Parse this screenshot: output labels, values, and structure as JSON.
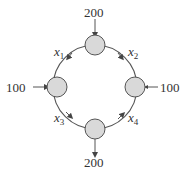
{
  "diagram": {
    "type": "network-flow",
    "nodes": [
      {
        "id": "top",
        "external": "200",
        "direction": "in"
      },
      {
        "id": "left",
        "external": "100",
        "direction": "in"
      },
      {
        "id": "right",
        "external": "100",
        "direction": "out"
      },
      {
        "id": "bottom",
        "external": "200",
        "direction": "out"
      }
    ],
    "edges": [
      {
        "var": "x",
        "sub": "1",
        "from": "top",
        "to": "left"
      },
      {
        "var": "x",
        "sub": "2",
        "from": "top",
        "to": "right"
      },
      {
        "var": "x",
        "sub": "3",
        "from": "left",
        "to": "bottom"
      },
      {
        "var": "x",
        "sub": "4",
        "from": "bottom",
        "to": "right"
      }
    ],
    "labels": {
      "top_flow": "200",
      "left_flow": "100",
      "right_flow": "100",
      "bottom_flow": "200",
      "x1_var": "x",
      "x1_sub": "1",
      "x2_var": "x",
      "x2_sub": "2",
      "x3_var": "x",
      "x3_sub": "3",
      "x4_var": "x",
      "x4_sub": "4"
    },
    "colors": {
      "node_fill": "#d9d9d9",
      "stroke": "#555555"
    }
  }
}
